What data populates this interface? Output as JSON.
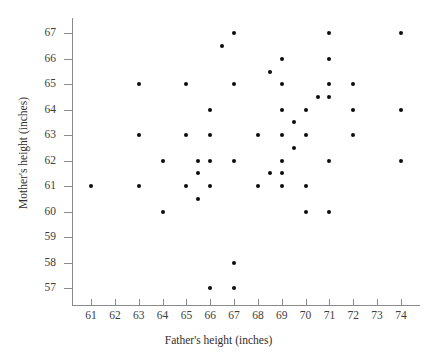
{
  "chart_data": {
    "type": "scatter",
    "title": "",
    "xlabel": "Father's height (inches)",
    "ylabel": "Mother's height (inches)",
    "xlim": [
      60.2,
      74.8
    ],
    "ylim": [
      56.3,
      67.6
    ],
    "xticks": [
      61,
      62,
      63,
      64,
      65,
      66,
      67,
      68,
      69,
      70,
      71,
      72,
      73,
      74
    ],
    "yticks": [
      57,
      58,
      59,
      60,
      61,
      62,
      63,
      64,
      65,
      66,
      67
    ],
    "xtick_labels": [
      "61",
      "62",
      "63",
      "64",
      "65",
      "66",
      "67",
      "68",
      "69",
      "70",
      "71",
      "72",
      "73",
      "74"
    ],
    "ytick_labels": [
      "57",
      "58",
      "59",
      "60",
      "61",
      "62",
      "63",
      "64",
      "65",
      "66",
      "67"
    ],
    "grid": false,
    "legend": null,
    "marker": {
      "shape": "circle",
      "color": "#0d0d0d",
      "size": 4
    },
    "points": [
      {
        "x": 61,
        "y": 61
      },
      {
        "x": 63,
        "y": 65
      },
      {
        "x": 63,
        "y": 63
      },
      {
        "x": 63,
        "y": 61
      },
      {
        "x": 64,
        "y": 62
      },
      {
        "x": 64,
        "y": 60
      },
      {
        "x": 65,
        "y": 65
      },
      {
        "x": 65,
        "y": 63
      },
      {
        "x": 65,
        "y": 61
      },
      {
        "x": 65.5,
        "y": 62
      },
      {
        "x": 65.5,
        "y": 61.5
      },
      {
        "x": 65.5,
        "y": 60.5
      },
      {
        "x": 66,
        "y": 64
      },
      {
        "x": 66,
        "y": 63
      },
      {
        "x": 66,
        "y": 62
      },
      {
        "x": 66,
        "y": 61
      },
      {
        "x": 66,
        "y": 57
      },
      {
        "x": 66.5,
        "y": 66.5
      },
      {
        "x": 67,
        "y": 67
      },
      {
        "x": 67,
        "y": 65
      },
      {
        "x": 67,
        "y": 62
      },
      {
        "x": 67,
        "y": 58
      },
      {
        "x": 67,
        "y": 57
      },
      {
        "x": 68,
        "y": 63
      },
      {
        "x": 68,
        "y": 61
      },
      {
        "x": 68.5,
        "y": 65.5
      },
      {
        "x": 68.5,
        "y": 61.5
      },
      {
        "x": 69,
        "y": 66
      },
      {
        "x": 69,
        "y": 65
      },
      {
        "x": 69,
        "y": 64
      },
      {
        "x": 69,
        "y": 63
      },
      {
        "x": 69,
        "y": 62
      },
      {
        "x": 69,
        "y": 61.5
      },
      {
        "x": 69,
        "y": 61
      },
      {
        "x": 69.5,
        "y": 63.5
      },
      {
        "x": 69.5,
        "y": 62.5
      },
      {
        "x": 70,
        "y": 64
      },
      {
        "x": 70,
        "y": 63
      },
      {
        "x": 70,
        "y": 61
      },
      {
        "x": 70,
        "y": 60
      },
      {
        "x": 70.5,
        "y": 64.5
      },
      {
        "x": 71,
        "y": 67
      },
      {
        "x": 71,
        "y": 66
      },
      {
        "x": 71,
        "y": 65
      },
      {
        "x": 71,
        "y": 64.5
      },
      {
        "x": 71,
        "y": 62
      },
      {
        "x": 71,
        "y": 60
      },
      {
        "x": 72,
        "y": 65
      },
      {
        "x": 72,
        "y": 64
      },
      {
        "x": 72,
        "y": 63
      },
      {
        "x": 74,
        "y": 67
      },
      {
        "x": 74,
        "y": 64
      },
      {
        "x": 74,
        "y": 62
      }
    ]
  }
}
